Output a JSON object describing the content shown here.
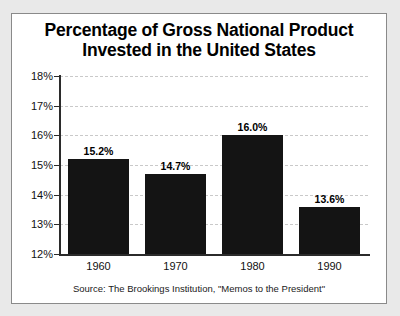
{
  "chart_data": {
    "type": "bar",
    "title": "Percentage of Gross National Product Invested in the United States",
    "title_lines": [
      "Percentage of Gross National Product",
      "Invested in the United States"
    ],
    "categories": [
      "1960",
      "1970",
      "1980",
      "1990"
    ],
    "values": [
      15.2,
      14.7,
      16.0,
      13.6
    ],
    "value_labels": [
      "15.2%",
      "14.7%",
      "16.0%",
      "13.6%"
    ],
    "xlabel": "",
    "ylabel": "",
    "ylim": [
      12,
      18
    ],
    "y_ticks": [
      18,
      17,
      16,
      15,
      14,
      13,
      12
    ],
    "y_tick_labels": [
      "18%",
      "17%",
      "16%",
      "15%",
      "14%",
      "13%",
      "12%"
    ],
    "grid": true,
    "legend": "none",
    "bar_color": "#141414",
    "background_color": "#ffffff",
    "gridline_color": "#c9c9c9",
    "axis_color": "#2b2b2b",
    "source": "Source: The Brookings Institution, \"Memos to the President\""
  }
}
